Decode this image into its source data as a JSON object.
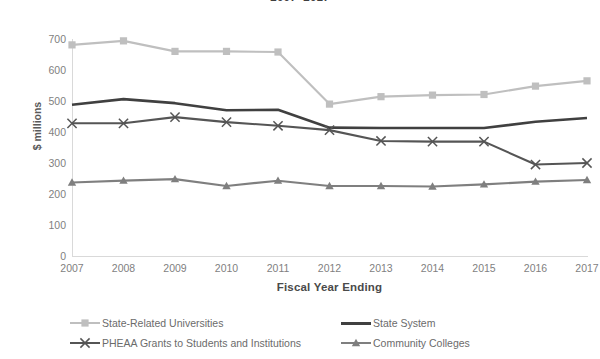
{
  "chart_data": {
    "type": "line",
    "title": "2007–2017",
    "xlabel": "Fiscal Year Ending",
    "ylabel": "$ millions",
    "categories": [
      "2007",
      "2008",
      "2009",
      "2010",
      "2011",
      "2012",
      "2013",
      "2014",
      "2015",
      "2016",
      "2017"
    ],
    "ylim": [
      0,
      700
    ],
    "yticks": [
      700,
      600,
      500,
      400,
      300,
      200,
      100,
      0
    ],
    "ytick_labels": [
      "700",
      "600",
      "500",
      "400",
      "300",
      "200",
      "100",
      "0"
    ],
    "grid": false,
    "legend_position": "bottom",
    "series": [
      {
        "name": "State-Related Universities",
        "color": "#bfbfbf",
        "marker": "square",
        "values": [
          681,
          694,
          660,
          660,
          658,
          490,
          514,
          519,
          521,
          548,
          565
        ]
      },
      {
        "name": "State System",
        "color": "#404040",
        "marker": "none",
        "values": [
          488,
          506,
          493,
          470,
          472,
          414,
          413,
          413,
          413,
          433,
          445
        ]
      },
      {
        "name": "PHEAA Grants to Students and Institutions",
        "color": "#555555",
        "marker": "x",
        "values": [
          428,
          428,
          448,
          432,
          420,
          406,
          371,
          369,
          369,
          295,
          300
        ]
      },
      {
        "name": "Community Colleges",
        "color": "#7f7f7f",
        "marker": "triangle",
        "values": [
          237,
          243,
          248,
          226,
          243,
          226,
          226,
          224,
          231,
          240,
          245
        ]
      }
    ]
  },
  "legend": {
    "items": [
      {
        "label": "State-Related Universities",
        "color": "#bfbfbf",
        "marker": "square"
      },
      {
        "label": "State System",
        "color": "#404040",
        "marker": "none"
      },
      {
        "label": "PHEAA Grants to Students and Institutions",
        "color": "#555555",
        "marker": "x"
      },
      {
        "label": "Community Colleges",
        "color": "#7f7f7f",
        "marker": "triangle"
      }
    ]
  }
}
